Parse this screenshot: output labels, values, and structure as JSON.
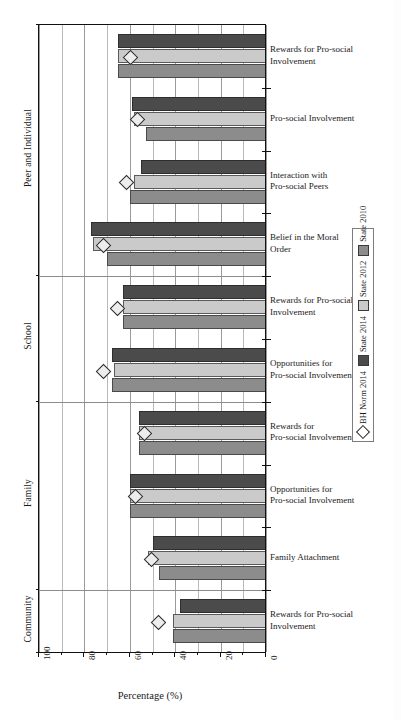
{
  "chart_data": {
    "type": "bar",
    "orientation": "horizontal",
    "title": "",
    "xlabel": "Percentage (%)",
    "ylabel": "",
    "xlim": [
      100,
      0
    ],
    "x_axis_reversed": true,
    "xticks": [
      100,
      90,
      80,
      70,
      60,
      50,
      40,
      30,
      20,
      10,
      0
    ],
    "xtick_labels_major": [
      "100",
      "80",
      "60",
      "40",
      "20",
      "0"
    ],
    "grid": true,
    "legend_position": "right-outside-vertical",
    "sections": [
      "Peer and Individual",
      "School",
      "Family",
      "Community"
    ],
    "categories": [
      "Rewards for Pro-social Involvement",
      "Pro-social Involvement",
      "Interaction with Pro-social Peers",
      "Belief in the Moral Order",
      "Rewards for Pro-social Involvement",
      "Opportunities for Pro-social Involvement",
      "Rewards for Pro-social Involvement",
      "Opportunities for Pro-social Involvement",
      "Family Attachment",
      "Rewards for Pro-social Involvement"
    ],
    "series": [
      {
        "name": "State 2014",
        "color": "#4b4b4b",
        "values": [
          65,
          59,
          55,
          77,
          63,
          68,
          56,
          60,
          50,
          38
        ]
      },
      {
        "name": "State 2012",
        "color": "#cacaca",
        "values": [
          65,
          58,
          58,
          76,
          63,
          67,
          56,
          60,
          52,
          41
        ]
      },
      {
        "name": "State 2010",
        "color": "#8c8c8c",
        "values": [
          65,
          53,
          60,
          70,
          63,
          68,
          56,
          60,
          47,
          41
        ]
      },
      {
        "name": "BH Norm 2014",
        "color": "#ededed",
        "marker": "diamond",
        "values": [
          60,
          57,
          62,
          72,
          66,
          72,
          54,
          58,
          51,
          48
        ]
      }
    ]
  },
  "axis": {
    "x_title": "Percentage (%)",
    "x_labels": [
      "100",
      "80",
      "60",
      "40",
      "20",
      "0"
    ]
  },
  "sections": [
    {
      "label": "Peer and Individual"
    },
    {
      "label": "School"
    },
    {
      "label": "Family"
    },
    {
      "label": "Community"
    }
  ],
  "measures": [
    {
      "line1": "Rewards for Pro-social",
      "line2": "Involvement"
    },
    {
      "line1": "Pro-social Involvement",
      "line2": ""
    },
    {
      "line1": "Interaction with",
      "line2": "Pro-social Peers"
    },
    {
      "line1": "Belief in the Moral",
      "line2": "Order"
    },
    {
      "line1": "Rewards for Pro-social",
      "line2": "Involvement"
    },
    {
      "line1": "Opportunities for",
      "line2": "Pro-social Involvement"
    },
    {
      "line1": "Rewards for",
      "line2": "Pro-social Involvement"
    },
    {
      "line1": "Opportunities for",
      "line2": "Pro-social Involvement"
    },
    {
      "line1": "Family Attachment",
      "line2": ""
    },
    {
      "line1": "Rewards for Pro-social",
      "line2": "Involvement"
    }
  ],
  "legend": {
    "items": [
      {
        "label": "BH Norm 2014",
        "type": "diamond"
      },
      {
        "label": "State 2014",
        "type": "swatch-2014"
      },
      {
        "label": "State 2012",
        "type": "swatch-2012"
      },
      {
        "label": "State 2010",
        "type": "swatch-2010"
      }
    ]
  }
}
